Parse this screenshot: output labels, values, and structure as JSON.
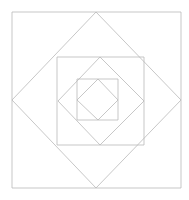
{
  "canvas": {
    "width": 189,
    "height": 200,
    "background_color": "#ffffff",
    "title": "Nested squares and inscribed rotated squares"
  },
  "style": {
    "stroke_color": "#b9b9b9",
    "stroke_color_light": "#c6c6c6",
    "stroke_width": 0.8,
    "fill": "none"
  },
  "chart_data": {
    "type": "diagram",
    "center": [
      96.5,
      100.0
    ],
    "shapes": [
      {
        "name": "outer-square",
        "kind": "square",
        "rotation_deg": 0,
        "points": [
          [
            12,
            12
          ],
          [
            181,
            12
          ],
          [
            181,
            188
          ],
          [
            12,
            188
          ]
        ],
        "bounds": {
          "x": 12,
          "y": 12,
          "width": 169,
          "height": 176
        }
      },
      {
        "name": "large-diamond",
        "kind": "rotated-square",
        "rotation_deg": 45,
        "points": [
          [
            96,
            12
          ],
          [
            181,
            100
          ],
          [
            96,
            188
          ],
          [
            12,
            100
          ]
        ],
        "bounds": {
          "x": 12,
          "y": 12,
          "width": 169,
          "height": 176
        }
      },
      {
        "name": "medium-square",
        "kind": "square",
        "rotation_deg": 0,
        "points": [
          [
            57,
            57
          ],
          [
            144,
            57
          ],
          [
            144,
            145
          ],
          [
            57,
            145
          ]
        ],
        "bounds": {
          "x": 57,
          "y": 57,
          "width": 87,
          "height": 88
        }
      },
      {
        "name": "medium-diamond",
        "kind": "rotated-square",
        "rotation_deg": 45,
        "points": [
          [
            100,
            57
          ],
          [
            144,
            101
          ],
          [
            100,
            145
          ],
          [
            58,
            101
          ]
        ],
        "bounds": {
          "x": 58,
          "y": 57,
          "width": 86,
          "height": 88
        }
      },
      {
        "name": "inner-square",
        "kind": "square",
        "rotation_deg": 0,
        "points": [
          [
            77,
            79
          ],
          [
            118,
            79
          ],
          [
            118,
            120
          ],
          [
            77,
            120
          ]
        ],
        "bounds": {
          "x": 77,
          "y": 79,
          "width": 41,
          "height": 41
        }
      },
      {
        "name": "inner-diamond",
        "kind": "rotated-square",
        "rotation_deg": 45,
        "points": [
          [
            98,
            79
          ],
          [
            118,
            100
          ],
          [
            98,
            120
          ],
          [
            77,
            100
          ]
        ],
        "bounds": {
          "x": 77,
          "y": 79,
          "width": 41,
          "height": 41
        }
      }
    ],
    "shape_count": 6,
    "xlim": [
      0,
      189
    ],
    "ylim": [
      0,
      200
    ],
    "grid": false,
    "legend": false,
    "axis_visible": false
  }
}
